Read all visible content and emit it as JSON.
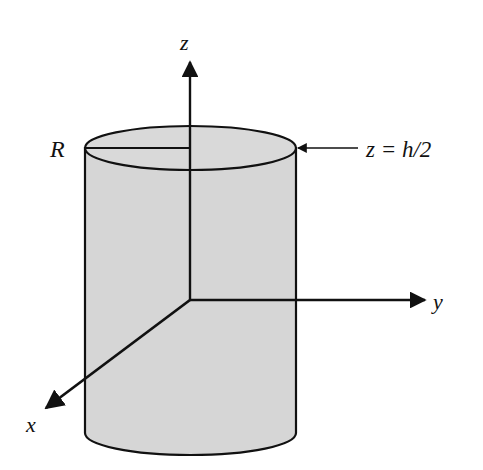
{
  "diagram": {
    "type": "3d-cylinder-coordinate-axes",
    "labels": {
      "z_axis": "z",
      "y_axis": "y",
      "x_axis": "x",
      "radius": "R",
      "top_plane": "z = h/2"
    },
    "colors": {
      "fill": "#d6d6d6",
      "stroke": "#111111",
      "background": "#ffffff"
    }
  }
}
